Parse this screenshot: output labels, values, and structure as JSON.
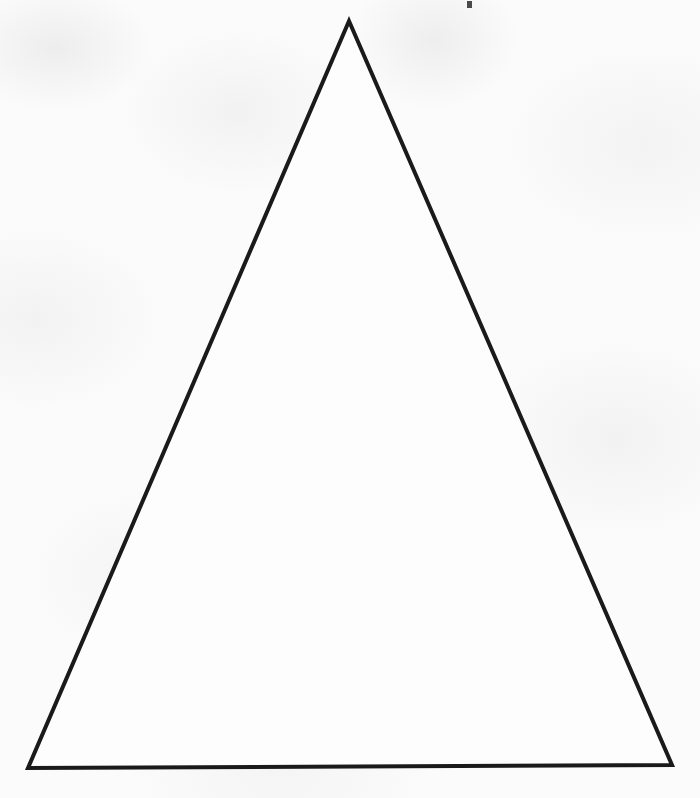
{
  "page": {
    "width": 700,
    "height": 798,
    "background_color": "#fbfbfb",
    "paper_tint": "#f7f7f8",
    "medium": "scanned printed page",
    "visible_text": "",
    "labels": []
  },
  "figure": {
    "name": "isosceles-triangle",
    "shape": "triangle",
    "stroke_color": "#1a1a1a",
    "fill_color": "#fdfdfd",
    "stroke_width": 4,
    "vertices": [
      {
        "name": "apex",
        "x": 349,
        "y": 21
      },
      {
        "name": "bottom-right",
        "x": 672,
        "y": 765
      },
      {
        "name": "bottom-left",
        "x": 28,
        "y": 768
      }
    ],
    "points_path": "349,21 672,765 28,768",
    "edges": [
      {
        "name": "left-side",
        "from": "apex",
        "to": "bottom-left"
      },
      {
        "name": "right-side",
        "from": "apex",
        "to": "bottom-right"
      },
      {
        "name": "base",
        "from": "bottom-left",
        "to": "bottom-right"
      }
    ]
  },
  "artifacts": [
    {
      "name": "scan-speck",
      "x": 467,
      "y": 1,
      "width": 5,
      "height": 7,
      "color": "#2a2a2a"
    }
  ]
}
